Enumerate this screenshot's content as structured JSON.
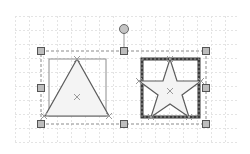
{
  "canvas": {
    "width": 250,
    "height": 154,
    "background": "#ffffff",
    "grid": {
      "color": "#e4e4e4",
      "spacing": 14,
      "x_start": 15,
      "x_end": 238,
      "y_start": 16,
      "y_end": 144
    }
  },
  "selection": {
    "border_color": "#8a8a8a",
    "handle_fill": "#bdbdbd",
    "handle_stroke": "#555555",
    "bounds": {
      "x": 41,
      "y": 51,
      "w": 165,
      "h": 73
    },
    "rotation_handle": {
      "cx": 124,
      "cy": 29,
      "r": 4.5,
      "fill": "#c4c4c4"
    }
  },
  "shapes": [
    {
      "id": "triangle",
      "label": "triangle-shape",
      "bbox": {
        "x": 49,
        "y": 59,
        "w": 57,
        "h": 57
      },
      "fill": "#f4f4f4",
      "stroke": "#666666"
    },
    {
      "id": "star",
      "label": "star-shape",
      "bbox": {
        "x": 142,
        "y": 59,
        "w": 57,
        "h": 58
      },
      "fill": "#f4f4f4",
      "stroke": "#666666",
      "selected_border": "#444444"
    }
  ]
}
